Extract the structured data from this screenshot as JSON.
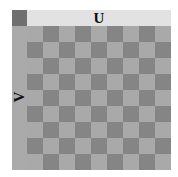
{
  "figure": {
    "u_axis_label": "U",
    "v_axis_label": "V",
    "grid": {
      "rows": 9,
      "columns": 9,
      "first_cell": "light"
    },
    "colors": {
      "light_cell": "#a9a9a9",
      "dark_cell": "#858585",
      "top_bar": "#e2e2e2",
      "left_bar": "#aaaaaa",
      "corner": "#6f6f6f"
    }
  }
}
